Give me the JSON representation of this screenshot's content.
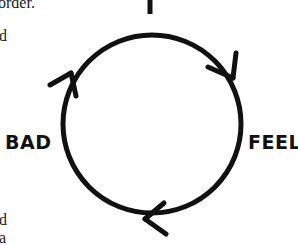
{
  "diagram": {
    "type": "cycle",
    "nodes": [
      {
        "id": "top",
        "label": ""
      },
      {
        "id": "right",
        "label": "FEEL"
      },
      {
        "id": "bottom",
        "label": ""
      },
      {
        "id": "left",
        "label": "BAD"
      }
    ],
    "direction": "clockwise",
    "stroke_color": "#111111"
  },
  "side_text": {
    "line1": "order.",
    "line2": "d",
    "line3": "d",
    "line4": "a"
  }
}
